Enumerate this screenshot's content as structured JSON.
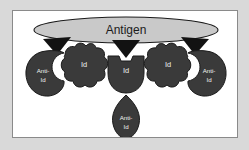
{
  "figure": {
    "background_color": "#d9d9d9",
    "panel_color": "#ffffff",
    "panel_border_color": "#8a8a8a",
    "shape_fill": "#3a3a3a",
    "shape_outline": "#1b1b1b",
    "antigen_fill": "#c9c9c9",
    "label_color": "#f2f2f2",
    "antigen_label_color": "#1b1b1b"
  },
  "antigen": {
    "label": "Antigen"
  },
  "arrows": {
    "left": "arrow-down-left",
    "center": "arrow-down-center",
    "right": "arrow-down-right"
  },
  "elements": [
    {
      "id": "left-anti-id",
      "label_line1": "Anti-",
      "label_line2": "Id",
      "shape": "crescent-blob-left"
    },
    {
      "id": "left-id",
      "label_line1": "Id",
      "label_line2": "",
      "shape": "lobed-blob"
    },
    {
      "id": "center-id",
      "label_line1": "Id",
      "label_line2": "",
      "shape": "t-block"
    },
    {
      "id": "center-anti-id",
      "label_line1": "Anti-",
      "label_line2": "Id",
      "shape": "leaf"
    },
    {
      "id": "right-id",
      "label_line1": "Id",
      "label_line2": "",
      "shape": "lobed-blob"
    },
    {
      "id": "right-anti-id",
      "label_line1": "Anti-",
      "label_line2": "Id",
      "shape": "crescent-blob-right"
    }
  ]
}
